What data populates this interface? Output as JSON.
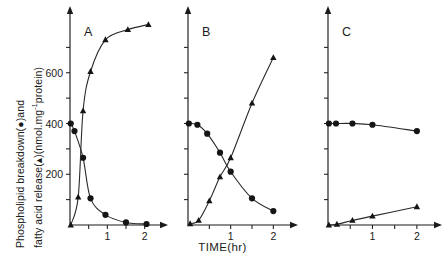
{
  "figure": {
    "y_axis_label_line1": "Phospholipid  breakdown(●)and",
    "y_axis_label_line2_pre": "fatty acid release(▴)(nmol.mg",
    "y_axis_label_sup": "-1",
    "y_axis_label_line2_post": "protein)",
    "x_axis_label": "TIME(hr)"
  },
  "chart_data": {
    "type": "line",
    "title": "",
    "xlabel": "TIME(hr)",
    "ylabel": "Phospholipid breakdown(●)and fatty acid release(▴)(nmol.mg-1protein)",
    "xlim": [
      0,
      2.25
    ],
    "ylim": [
      0,
      800
    ],
    "grid": false,
    "legend": "none",
    "panels": [
      {
        "label": "A",
        "xticks": [
          1,
          2
        ],
        "xticklabels": [
          "1",
          "2"
        ],
        "yticks": [
          200,
          400,
          600
        ],
        "yticklabels": [
          "200",
          "400",
          "600"
        ],
        "series": [
          {
            "name": "Phospholipid breakdown",
            "marker": "circle",
            "x": [
              0.02,
              0.12,
              0.35,
              0.55,
              0.95,
              1.5,
              2.05
            ],
            "values": [
              400,
              370,
              265,
              105,
              40,
              10,
              4
            ]
          },
          {
            "name": "Fatty acid release",
            "marker": "triangle",
            "x": [
              0.02,
              0.22,
              0.35,
              0.55,
              0.95,
              1.55,
              2.1
            ],
            "values": [
              0,
              110,
              450,
              605,
              730,
              770,
              790
            ]
          }
        ]
      },
      {
        "label": "B",
        "xticks": [
          1,
          2
        ],
        "xticklabels": [
          "1",
          "2"
        ],
        "yticks": [],
        "yticklabels": [],
        "series": [
          {
            "name": "Phospholipid breakdown",
            "marker": "circle",
            "x": [
              0.02,
              0.22,
              0.45,
              0.75,
              1.0,
              1.5,
              2.0
            ],
            "values": [
              400,
              395,
              360,
              285,
              210,
              105,
              55
            ]
          },
          {
            "name": "Fatty acid release",
            "marker": "triangle",
            "x": [
              0.05,
              0.25,
              0.5,
              0.75,
              1.0,
              1.5,
              2.0
            ],
            "values": [
              5,
              18,
              95,
              190,
              265,
              480,
              660
            ]
          }
        ]
      },
      {
        "label": "C",
        "xticks": [
          1,
          2
        ],
        "xticklabels": [
          "1",
          "2"
        ],
        "yticks": [],
        "yticklabels": [],
        "series": [
          {
            "name": "Phospholipid breakdown",
            "marker": "circle",
            "x": [
              0.02,
              0.18,
              0.55,
              1.0,
              2.0
            ],
            "values": [
              400,
              400,
              400,
              395,
              370
            ]
          },
          {
            "name": "Fatty acid release",
            "marker": "triangle",
            "x": [
              0.02,
              0.2,
              0.55,
              1.0,
              2.0
            ],
            "values": [
              0,
              3,
              18,
              35,
              72
            ]
          }
        ]
      }
    ]
  }
}
